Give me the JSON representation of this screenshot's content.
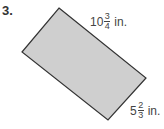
{
  "problem": {
    "number": "3.",
    "shape": "rectangle",
    "fill_color": "#cfcfcf",
    "stroke_color": "#333333",
    "length": {
      "whole": "10",
      "numerator": "3",
      "denominator": "4",
      "unit": "in."
    },
    "width": {
      "whole": "5",
      "numerator": "2",
      "denominator": "3",
      "unit": "in."
    }
  }
}
